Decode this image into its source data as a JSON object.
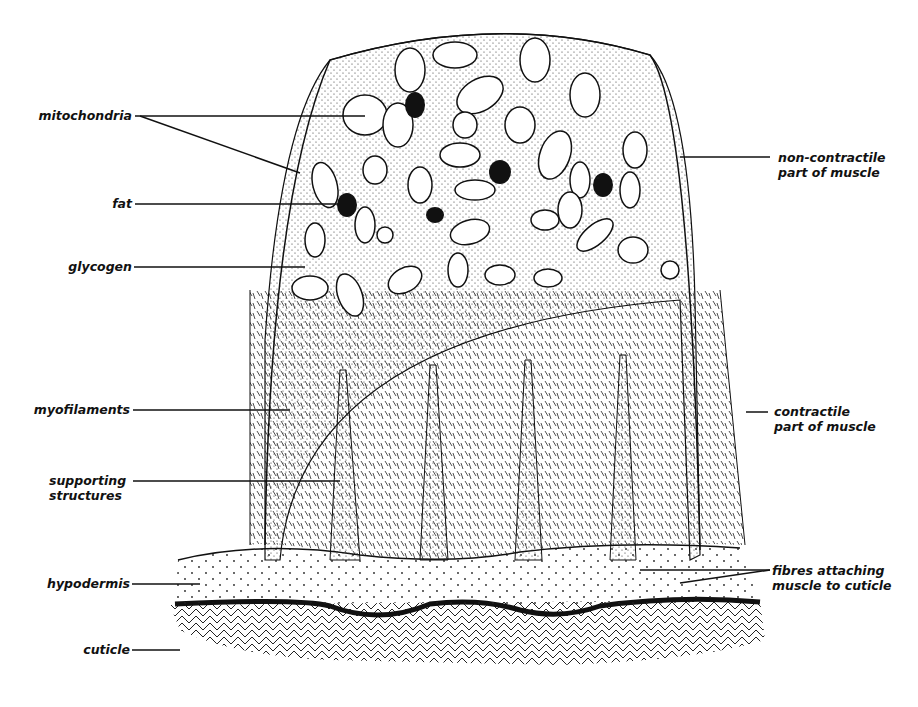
{
  "diagram": {
    "labels_left": [
      {
        "id": "mitochondria",
        "text": "mitochondria"
      },
      {
        "id": "fat",
        "text": "fat"
      },
      {
        "id": "glycogen",
        "text": "glycogen"
      },
      {
        "id": "myofilaments",
        "text": "myofilaments"
      },
      {
        "id": "supporting",
        "line1": "supporting",
        "line2": "structures"
      },
      {
        "id": "hypodermis",
        "text": "hypodermis"
      },
      {
        "id": "cuticle",
        "text": "cuticle"
      }
    ],
    "labels_right": [
      {
        "id": "noncontractile",
        "line1": "non-contractile",
        "line2": "part of muscle"
      },
      {
        "id": "contractile",
        "line1": "contractile",
        "line2": "part of muscle"
      },
      {
        "id": "fibres",
        "line1": "fibres attaching",
        "line2": "muscle to cuticle"
      }
    ],
    "colors": {
      "ink": "#111111",
      "paper": "#ffffff"
    }
  }
}
